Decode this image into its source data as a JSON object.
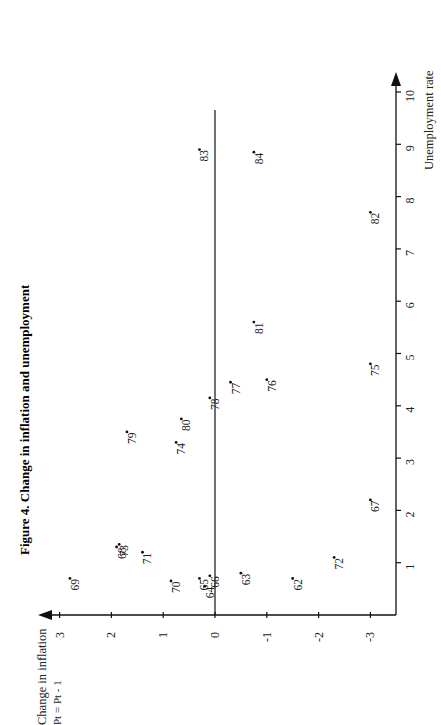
{
  "figure": {
    "title": "Figure 4. Change in inflation and unemployment",
    "orientation": "rotated 90 degrees counter-clockwise"
  },
  "axes": {
    "x_axis_label": "Unemployment rate",
    "y_axis_label_line1": "Change in inflation",
    "y_axis_label_line2": "Pt = Pt - 1",
    "x_ticks": [
      "1",
      "2",
      "3",
      "4",
      "5",
      "6",
      "7",
      "8",
      "9",
      "10"
    ],
    "y_ticks": [
      "3",
      "2",
      "1",
      "0",
      "-1",
      "-2",
      "-3"
    ]
  },
  "chart_data": {
    "type": "scatter",
    "title": "Figure 4. Change in inflation and unemployment",
    "xlabel": "Unemployment rate",
    "ylabel": "Change in inflation (Pt = Pt - 1)",
    "xlim": [
      0,
      10
    ],
    "ylim": [
      -3.5,
      3.2
    ],
    "x_ticks": [
      1,
      2,
      3,
      4,
      5,
      6,
      7,
      8,
      9,
      10
    ],
    "y_ticks": [
      3,
      2,
      1,
      0,
      -1,
      -2,
      -3
    ],
    "grid": false,
    "legend": null,
    "zero_line": true,
    "points": [
      {
        "label": "62",
        "x": 0.7,
        "y": -1.5
      },
      {
        "label": "63",
        "x": 0.8,
        "y": -0.5
      },
      {
        "label": "64",
        "x": 0.55,
        "y": 0.2
      },
      {
        "label": "65",
        "x": 0.7,
        "y": 0.3
      },
      {
        "label": "66",
        "x": 0.75,
        "y": 0.1
      },
      {
        "label": "67",
        "x": 2.2,
        "y": -3.0
      },
      {
        "label": "68",
        "x": 1.3,
        "y": 1.9
      },
      {
        "label": "69",
        "x": 0.7,
        "y": 2.8
      },
      {
        "label": "70",
        "x": 0.65,
        "y": 0.85
      },
      {
        "label": "71",
        "x": 1.2,
        "y": 1.4
      },
      {
        "label": "72",
        "x": 1.1,
        "y": -2.3
      },
      {
        "label": "73",
        "x": 1.35,
        "y": 1.85
      },
      {
        "label": "74",
        "x": 3.3,
        "y": 0.75
      },
      {
        "label": "75",
        "x": 4.8,
        "y": -3.0
      },
      {
        "label": "76",
        "x": 4.5,
        "y": -1.0
      },
      {
        "label": "77",
        "x": 4.45,
        "y": -0.3
      },
      {
        "label": "78",
        "x": 4.15,
        "y": 0.1
      },
      {
        "label": "79",
        "x": 3.5,
        "y": 1.7
      },
      {
        "label": "80",
        "x": 3.75,
        "y": 0.65
      },
      {
        "label": "81",
        "x": 5.6,
        "y": -0.75
      },
      {
        "label": "82",
        "x": 7.7,
        "y": -3.0
      },
      {
        "label": "83",
        "x": 8.9,
        "y": 0.3
      },
      {
        "label": "84",
        "x": 8.85,
        "y": -0.75
      }
    ]
  }
}
